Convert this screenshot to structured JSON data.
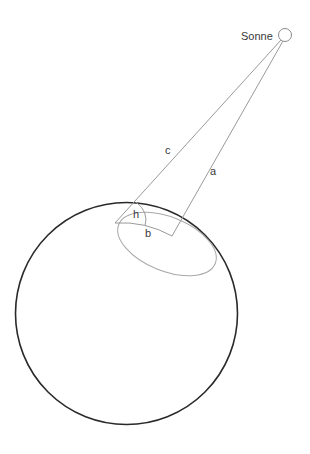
{
  "diagram": {
    "labels": {
      "sun": "Sonne",
      "a": "a",
      "b": "b",
      "c": "c",
      "h": "h"
    },
    "colors": {
      "earth_stroke": "#2a2a2a",
      "line_stroke": "#9a9a9a",
      "ellipse_stroke": "#a0a0a0",
      "text": "#3a3a3a"
    },
    "elements": [
      {
        "id": "earth",
        "type": "circle",
        "label": "Erde"
      },
      {
        "id": "sun",
        "type": "circle",
        "label": "Sonne"
      },
      {
        "id": "line-c",
        "type": "line",
        "label": "c"
      },
      {
        "id": "line-a",
        "type": "line",
        "label": "a"
      },
      {
        "id": "arc-b",
        "type": "arc",
        "label": "b"
      },
      {
        "id": "angle-h",
        "type": "angle",
        "label": "h"
      },
      {
        "id": "horizon-ellipse",
        "type": "ellipse"
      }
    ]
  }
}
